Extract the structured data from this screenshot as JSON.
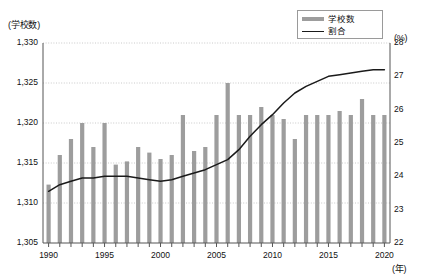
{
  "chart_data": {
    "type": "bar",
    "title": "",
    "xlabel": "(年)",
    "categories": [
      1990,
      1991,
      1992,
      1993,
      1994,
      1995,
      1996,
      1997,
      1998,
      1999,
      2000,
      2001,
      2002,
      2003,
      2004,
      2005,
      2006,
      2007,
      2008,
      2009,
      2010,
      2011,
      2012,
      2013,
      2014,
      2015,
      2016,
      2017,
      2018,
      2019,
      2020
    ],
    "xticks": [
      1990,
      1995,
      2000,
      2005,
      2010,
      2015,
      2020
    ],
    "grid": true,
    "legend_position": "top-right",
    "series": [
      {
        "name": "学校数",
        "type": "bar",
        "axis": "left",
        "unit": "(学校数)",
        "color": "#9d9d9d",
        "ylim": [
          1305,
          1330
        ],
        "yticks": [
          "1,305",
          "1,310",
          "1,315",
          "1,320",
          "1,325",
          "1,330"
        ],
        "ytick_values": [
          1305,
          1310,
          1315,
          1320,
          1325,
          1330
        ],
        "values": [
          1312.3,
          1316,
          1318,
          1320,
          1317,
          1320,
          1314.8,
          1315.2,
          1317,
          1316.3,
          1315.5,
          1316,
          1321,
          1316.5,
          1317,
          1321,
          1325,
          1321,
          1321,
          1322,
          1321,
          1320.5,
          1318,
          1321,
          1321,
          1321,
          1321.5,
          1321,
          1323,
          1321,
          1321
        ]
      },
      {
        "name": "割合",
        "type": "line",
        "axis": "right",
        "unit": "(%)",
        "color": "#1a1a1a",
        "ylim": [
          22,
          28
        ],
        "yticks": [
          "22",
          "23",
          "24",
          "25",
          "26",
          "27",
          "28"
        ],
        "ytick_values": [
          22,
          23,
          24,
          25,
          26,
          27,
          28
        ],
        "values": [
          23.55,
          23.75,
          23.85,
          23.95,
          23.95,
          24.0,
          24.0,
          24.0,
          23.95,
          23.9,
          23.85,
          23.9,
          24.0,
          24.1,
          24.2,
          24.35,
          24.5,
          24.8,
          25.2,
          25.55,
          25.85,
          26.2,
          26.5,
          26.7,
          26.85,
          27.0,
          27.05,
          27.1,
          27.15,
          27.2,
          27.2
        ]
      }
    ]
  },
  "legend": {
    "items": [
      {
        "label": "学校数",
        "marker": "bar-swatch"
      },
      {
        "label": "割合",
        "marker": "line-swatch"
      }
    ]
  },
  "axes": {
    "left_unit": "(学校数)",
    "right_unit": "(%)",
    "x_unit": "(年)"
  }
}
